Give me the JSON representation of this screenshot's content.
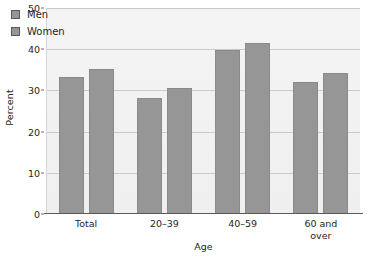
{
  "chart_data": {
    "type": "bar",
    "title": "",
    "subtitle": "",
    "xlabel": "Age",
    "ylabel": "Percent",
    "categories": [
      "Total",
      "20–39",
      "40–59",
      "60 and\nover"
    ],
    "series": [
      {
        "name": "Men",
        "values": [
          33.3,
          28.2,
          39.9,
          32.0
        ]
      },
      {
        "name": "Women",
        "values": [
          35.2,
          30.5,
          41.5,
          34.2
        ]
      }
    ],
    "ylim": [
      0,
      50
    ],
    "yticks": [
      0,
      10,
      20,
      30,
      40,
      50
    ],
    "ytick_labels": [
      "0",
      "10",
      "20",
      "30",
      "40",
      "50"
    ],
    "grid": true,
    "grid_axis": "y",
    "legend_position": "top-left-inside",
    "annotations": [],
    "colors": {
      "bar_fill": "#969696",
      "bar_edge": "#8a8a8a",
      "plot_background": "#f2f2f2",
      "gridline": "#c9cacc",
      "axis_line": "#58595b",
      "text": "#231f20",
      "figure_background": "#ffffff"
    }
  },
  "legend": {
    "items": [
      {
        "label": "Men"
      },
      {
        "label": "Women"
      }
    ]
  },
  "axes": {
    "y_title": "Percent",
    "x_title": "Age"
  }
}
